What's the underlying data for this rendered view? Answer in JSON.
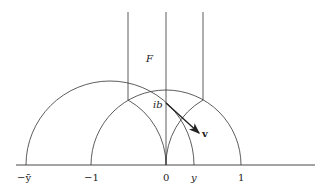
{
  "diagram": {
    "type": "hyperbolic upper half-plane fundamental domain",
    "region_label": "F",
    "point_label": "ib",
    "vector_label": "v",
    "axis_labels": [
      "−ȳ",
      "−1",
      "0",
      "y",
      "1"
    ],
    "colors": {
      "stroke": "#333333",
      "background": "#ffffff"
    }
  }
}
